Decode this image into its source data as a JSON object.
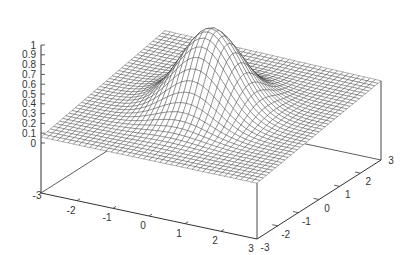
{
  "chart_data": {
    "type": "surface3d",
    "title": "",
    "function": "z = exp(-(x^2 + y^2)) style Gaussian bump over a slightly tilted base",
    "x_axis": {
      "label": "",
      "range": [
        -3,
        3
      ],
      "ticks": [
        "-3",
        "-2",
        "-1",
        "0",
        "1",
        "2",
        "3"
      ]
    },
    "y_axis": {
      "label": "",
      "range": [
        -3,
        3
      ],
      "ticks": [
        "-3",
        "-2",
        "-1",
        "0",
        "1",
        "2",
        "3"
      ]
    },
    "z_axis": {
      "label": "",
      "range": [
        0,
        1
      ],
      "ticks": [
        "0",
        "0.1",
        "0.2",
        "0.3",
        "0.4",
        "0.5",
        "0.6",
        "0.7",
        "0.8",
        "0.9",
        "1"
      ]
    },
    "surface": {
      "style": "wireframe mesh",
      "grid_resolution": 40,
      "peak": {
        "x": 0,
        "y": 0,
        "z": 1
      },
      "base_level_approx": [
        0.05,
        0.35
      ],
      "line_color": "#222222"
    },
    "grid": false,
    "legend": null
  },
  "labels": {
    "z_ticks": [
      "1",
      "0.9",
      "0.8",
      "0.7",
      "0.6",
      "0.5",
      "0.4",
      "0.3",
      "0.2",
      "0.1",
      "0"
    ],
    "x_ticks": [
      "-3",
      "-2",
      "-1",
      "0",
      "1",
      "2",
      "3"
    ],
    "y_ticks": [
      "-3",
      "-2",
      "-1",
      "0",
      "1",
      "2",
      "3"
    ]
  }
}
